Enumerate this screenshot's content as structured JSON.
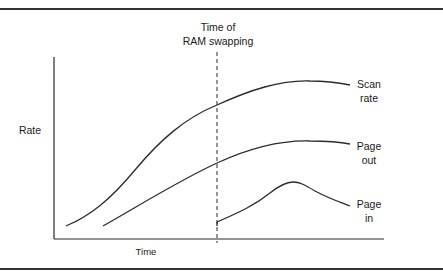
{
  "diagram": {
    "annotation": {
      "line1": "Time of",
      "line2": "RAM swapping"
    },
    "axes": {
      "y_label": "Rate",
      "x_label": "Time"
    },
    "series": [
      {
        "name": "Scan rate",
        "label_line1": "Scan",
        "label_line2": "rate"
      },
      {
        "name": "Page out",
        "label_line1": "Page",
        "label_line2": "out"
      },
      {
        "name": "Page in",
        "label_line1": "Page",
        "label_line2": "in"
      }
    ],
    "colors": {
      "line": "#2b2b2b",
      "border": "#333333",
      "background": "#ffffff"
    }
  }
}
